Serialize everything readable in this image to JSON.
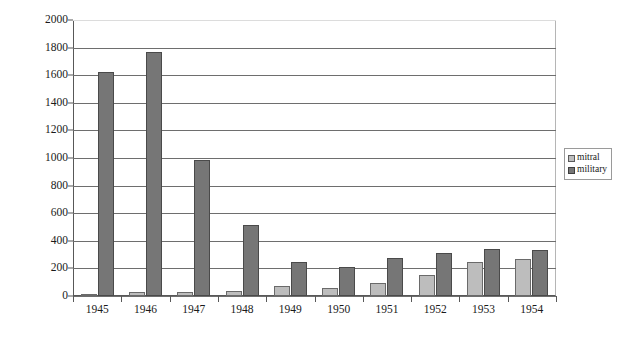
{
  "chart_data": {
    "type": "bar",
    "title": "",
    "subtitle": "",
    "xlabel": "",
    "ylabel": "",
    "categories": [
      "1945",
      "1946",
      "1947",
      "1948",
      "1949",
      "1950",
      "1951",
      "1952",
      "1953",
      "1954"
    ],
    "series": [
      {
        "name": "mitral",
        "color": "#bdbdbd",
        "values": [
          15,
          30,
          30,
          35,
          75,
          60,
          95,
          155,
          250,
          270
        ]
      },
      {
        "name": "military",
        "color": "#767676",
        "values": [
          1620,
          1770,
          985,
          515,
          250,
          210,
          275,
          315,
          340,
          330
        ]
      }
    ],
    "ylim": [
      0,
      2000
    ],
    "ytick_step": 200,
    "yticks": [
      "0",
      "200",
      "400",
      "600",
      "800",
      "1000",
      "1200",
      "1400",
      "1600",
      "1800",
      "2000"
    ],
    "grid": true,
    "grid_axis": "y",
    "legend": {
      "position": "right",
      "entries": [
        {
          "label": "mitral",
          "swatch": "mitral-swatch"
        },
        {
          "label": "military",
          "swatch": "military-swatch"
        }
      ]
    },
    "colors": {
      "mitral": "#bdbdbd",
      "military": "#767676",
      "gridline": "#6e6e6e",
      "axis": "#585858",
      "background": "#ffffff",
      "text": "#1a1a1a"
    }
  }
}
